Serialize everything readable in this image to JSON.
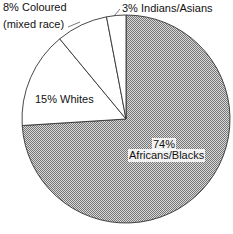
{
  "chart_data": {
    "type": "pie",
    "title": "",
    "slices": [
      {
        "label": "Africans/Blacks",
        "value": 74,
        "display": "74%",
        "pattern": "dotted-grey"
      },
      {
        "label": "Whites",
        "value": 15,
        "display": "15% Whites",
        "pattern": "white"
      },
      {
        "label": "Coloured (mixed race)",
        "value": 8,
        "display": "8% Coloured",
        "pattern": "white"
      },
      {
        "label": "Indians/Asians",
        "value": 3,
        "display": "3% Indians/Asians",
        "pattern": "white"
      }
    ],
    "start_angle_deg": 0,
    "direction": "clockwise-from-top",
    "legend": "none (direct labels)"
  },
  "labels": {
    "africans_pct": "74%",
    "africans_name": "Africans/Blacks",
    "whites": "15% Whites",
    "coloured_line1": "8% Coloured",
    "coloured_line2": "(mixed race)",
    "indians": "3% Indians/Asians"
  },
  "colors": {
    "outline": "#333333",
    "fill_light": "#ffffff",
    "fill_dots": "#888888"
  }
}
